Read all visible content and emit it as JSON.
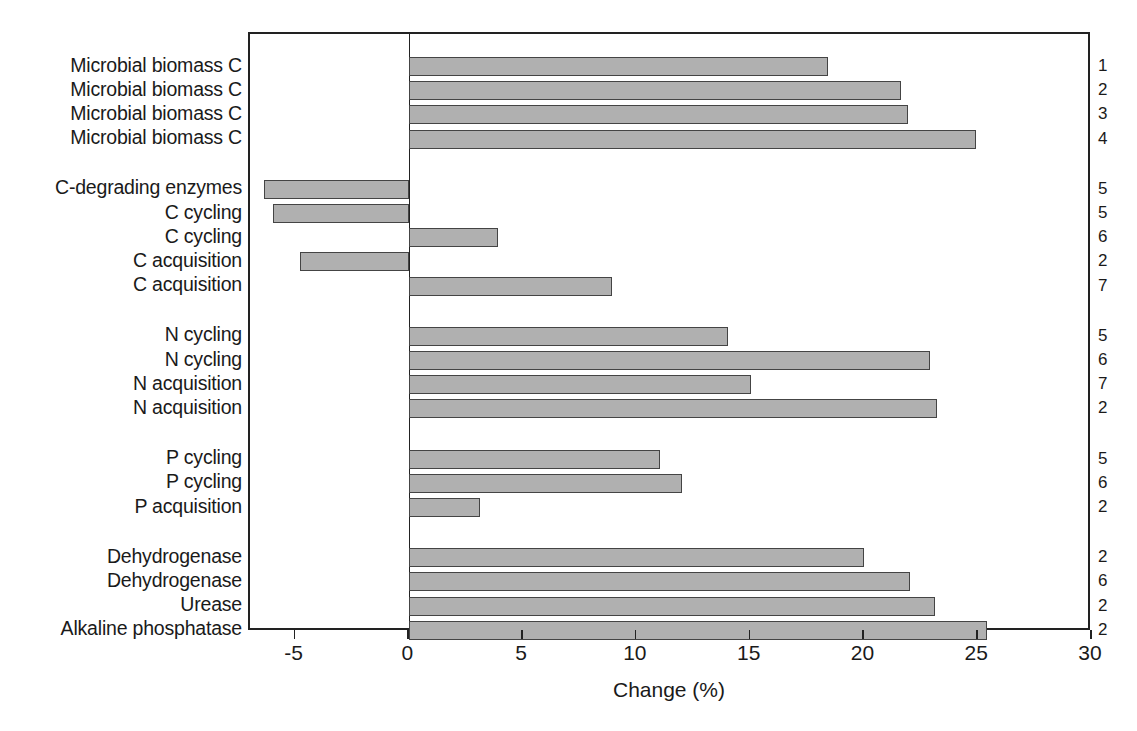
{
  "chart_data": {
    "type": "bar",
    "orientation": "horizontal",
    "title": "",
    "xlabel": "Change (%)",
    "ylabel": "",
    "xlim": [
      -7,
      30
    ],
    "xticks": [
      -5,
      0,
      5,
      10,
      15,
      20,
      25,
      30
    ],
    "xticklabels": [
      "-5",
      "0",
      "5",
      "10",
      "15",
      "20",
      "25",
      "30"
    ],
    "grid": false,
    "legend": false,
    "zero_reference_line": true,
    "groups": [
      {
        "name": "Microbial biomass C",
        "items": [
          {
            "category": "Microbial biomass C",
            "value": 18.4,
            "ref": "1"
          },
          {
            "category": "Microbial biomass C",
            "value": 21.6,
            "ref": "2"
          },
          {
            "category": "Microbial biomass C",
            "value": 21.9,
            "ref": "3"
          },
          {
            "category": "Microbial biomass C",
            "value": 24.9,
            "ref": "4"
          }
        ]
      },
      {
        "name": "Carbon",
        "items": [
          {
            "category": "C-degrading enzymes",
            "value": -6.4,
            "ref": "5"
          },
          {
            "category": "C cycling",
            "value": -6.0,
            "ref": "5"
          },
          {
            "category": "C cycling",
            "value": 3.9,
            "ref": "6"
          },
          {
            "category": "C acquisition",
            "value": -4.8,
            "ref": "2"
          },
          {
            "category": "C acquisition",
            "value": 8.9,
            "ref": "7"
          }
        ]
      },
      {
        "name": "Nitrogen",
        "items": [
          {
            "category": "N cycling",
            "value": 14.0,
            "ref": "5"
          },
          {
            "category": "N cycling",
            "value": 22.9,
            "ref": "6"
          },
          {
            "category": "N acquisition",
            "value": 15.0,
            "ref": "7"
          },
          {
            "category": "N acquisition",
            "value": 23.2,
            "ref": "2"
          }
        ]
      },
      {
        "name": "Phosphorus",
        "items": [
          {
            "category": "P cycling",
            "value": 11.0,
            "ref": "5"
          },
          {
            "category": "P cycling",
            "value": 12.0,
            "ref": "6"
          },
          {
            "category": "P acquisition",
            "value": 3.1,
            "ref": "2"
          }
        ]
      },
      {
        "name": "Specific enzymes",
        "items": [
          {
            "category": "Dehydrogenase",
            "value": 20.0,
            "ref": "2"
          },
          {
            "category": "Dehydrogenase",
            "value": 22.0,
            "ref": "6"
          },
          {
            "category": "Urease",
            "value": 23.1,
            "ref": "2"
          },
          {
            "category": "Alkaline phosphatase",
            "value": 25.4,
            "ref": "2"
          }
        ]
      }
    ]
  },
  "style": {
    "bar_fill": "#b0b0b0",
    "bar_stroke": "#444444",
    "axis_color": "#222222",
    "background": "#ffffff"
  }
}
